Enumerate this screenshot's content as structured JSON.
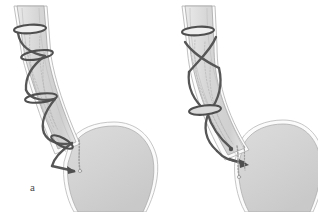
{
  "figure": {
    "background_color": "#ffffff",
    "width": 318,
    "height": 212,
    "panel_count": 2
  },
  "palette": {
    "background": "#ffffff",
    "organ_fill": "#d4d4d4",
    "organ_fill_light": "#e3e3e3",
    "organ_outline": "#9a9a9a",
    "organ_outline_white": "#fbfbfb",
    "suture_dark": "#555555",
    "suture_mid": "#7d7d7d",
    "suture_light": "#b4b4b4",
    "label_color": "#4a4a4a"
  },
  "panels": [
    {
      "id": "a",
      "label": "a",
      "label_x": 30,
      "label_y": 182,
      "anatomy": {
        "esophagus": "tubular structure descending from top-left, curving right toward the gastroesophageal junction",
        "stomach": "large rounded gray fundus body occupying lower right of the panel"
      },
      "instruments": {
        "helical_suture_turns": 4,
        "band_count": 4,
        "bands": [
          {
            "cx": 30,
            "cy": 29,
            "rx": 16,
            "ry": 4.2,
            "rot": -4
          },
          {
            "cx": 37,
            "cy": 55,
            "rx": 16,
            "ry": 4.4,
            "rot": -9
          },
          {
            "cx": 41,
            "cy": 98,
            "rx": 16,
            "ry": 4.4,
            "rot": -7
          },
          {
            "cx": 63,
            "cy": 143,
            "rx": 12,
            "ry": 4.0,
            "rot": 28
          }
        ],
        "arrow_tip": {
          "x": 72,
          "y": 168
        },
        "dotted_suture_tail": {
          "x": 80,
          "y": 141,
          "length": 26
        }
      }
    },
    {
      "id": "b",
      "label": "b",
      "label_x": 42,
      "label_y": 184,
      "anatomy": {
        "esophagus": "tubular structure descending from top, angled with a pronounced curve to the right",
        "stomach": "large rounded gray fundus body occupying lower right of the panel"
      },
      "instruments": {
        "helical_suture_turns": 2,
        "crossing_pattern": "X shaped crossing of two suture strands in the upper third",
        "band_count": 2,
        "bands": [
          {
            "cx": 39,
            "cy": 31,
            "rx": 16,
            "ry": 4.2,
            "rot": -4
          },
          {
            "cx": 45,
            "cy": 110,
            "rx": 16,
            "ry": 4.6,
            "rot": -6
          }
        ],
        "arrow_tip": {
          "x": 89,
          "y": 163
        },
        "dotted_suture_tail": {
          "x": 78,
          "y": 150,
          "length": 24
        }
      }
    }
  ]
}
